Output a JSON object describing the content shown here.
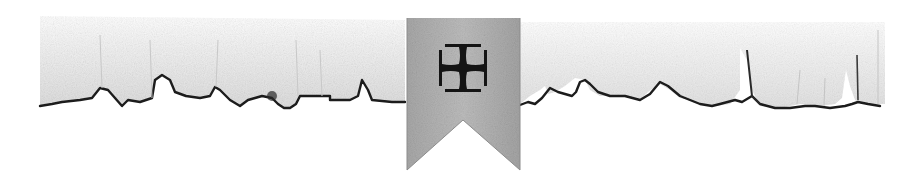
{
  "divider": {
    "description": "Decorative torn-parchment divider with central heraldic pennant",
    "icon": "cross-pattee-icon",
    "colors": {
      "background": "#ffffff",
      "parchment": "#ececec",
      "parchment_shadow": "#d4d4d4",
      "torn_edge": "#1c1c1c",
      "banner": "#b4b4b4",
      "banner_dark": "#9a9a9a",
      "cross": "#141414"
    }
  }
}
